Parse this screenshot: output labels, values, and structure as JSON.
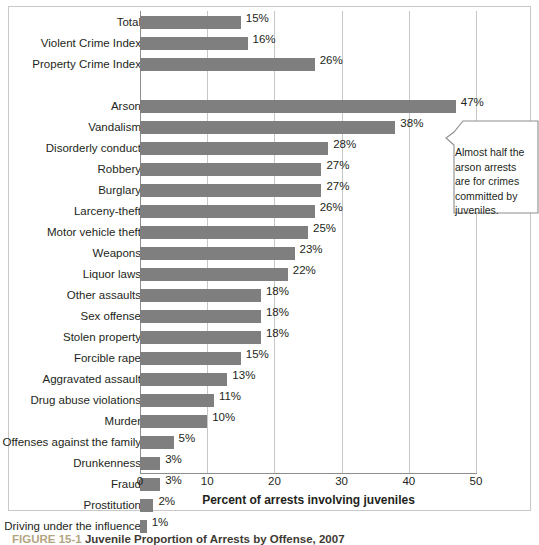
{
  "figure": {
    "caption_number": "FIGURE 15-1",
    "caption_title": "Juvenile Proportion of Arrests by Offense, 2007"
  },
  "callout": {
    "text": "Almost half the arson arrests are for crimes committed by juveniles."
  },
  "chart_data": {
    "type": "bar",
    "orientation": "horizontal",
    "title": "",
    "xlabel": "Percent of arrests involving juveniles",
    "ylabel": "",
    "xlim": [
      0,
      50
    ],
    "xticks": [
      0,
      10,
      20,
      30,
      40,
      50
    ],
    "xtick_labels": [
      "0",
      "10",
      "20",
      "30",
      "40",
      "50"
    ],
    "grid": true,
    "legend": "none",
    "value_suffix": "%",
    "bar_color": "#7f7f7f",
    "categories": [
      "Total",
      "Violent Crime Index",
      "Property Crime Index",
      "",
      "Arson",
      "Vandalism",
      "Disorderly conduct",
      "Robbery",
      "Burglary",
      "Larceny-theft",
      "Motor vehicle theft",
      "Weapons",
      "Liquor laws",
      "Other assaults",
      "Sex offense",
      "Stolen property",
      "Forcible rape",
      "Aggravated assault",
      "Drug abuse violations",
      "Murder",
      "Offenses against the family",
      "Drunkenness",
      "Fraud",
      "Prostitution",
      "Driving under the influence"
    ],
    "values": [
      15,
      16,
      26,
      null,
      47,
      38,
      28,
      27,
      27,
      26,
      25,
      23,
      22,
      18,
      18,
      18,
      15,
      13,
      11,
      10,
      5,
      3,
      3,
      2,
      1
    ],
    "value_labels": [
      "15%",
      "16%",
      "26%",
      "",
      "47%",
      "38%",
      "28%",
      "27%",
      "27%",
      "26%",
      "25%",
      "23%",
      "22%",
      "18%",
      "18%",
      "18%",
      "15%",
      "13%",
      "11%",
      "10%",
      "5%",
      "3%",
      "3%",
      "2%",
      "1%"
    ]
  }
}
